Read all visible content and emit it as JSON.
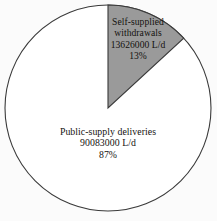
{
  "figure": {
    "background_color": "#fbfbfb",
    "text_color": "#14120f",
    "outline_color": "#3a3a3a"
  },
  "pie": {
    "center_x": 108,
    "center_y": 108,
    "radius": 103,
    "start_angle_deg": 0,
    "direction": "clockwise"
  },
  "slices": {
    "self_supplied": {
      "name_line1": "Self-supplied",
      "name_line2": "withdrawals",
      "value_label": "13626000 L/d",
      "percent_label": "13%",
      "fill_color": "#9a9a9a"
    },
    "public_supply": {
      "name_line1": "Public-supply deliveries",
      "value_label": "90083000 L/d",
      "percent_label": "87%",
      "fill_color": "#ffffff"
    }
  },
  "chart_data": {
    "type": "pie",
    "title": "",
    "subtitle": "",
    "xlabel": "",
    "ylabel": "",
    "units": "L/d",
    "grid": false,
    "legend": false,
    "legend_position": "none",
    "labels_inside_slices": true,
    "start_angle_deg": 90,
    "counterclock": false,
    "categories": [
      "Self-supplied withdrawals",
      "Public-supply deliveries"
    ],
    "values": [
      13626000,
      90083000
    ],
    "percentages": [
      13,
      87
    ],
    "colors": [
      "#9a9a9a",
      "#ffffff"
    ],
    "annotations": [
      "Self-supplied withdrawals 13626000 L/d 13%",
      "Public-supply deliveries 90083000 L/d 87%"
    ],
    "total": 103709000
  }
}
